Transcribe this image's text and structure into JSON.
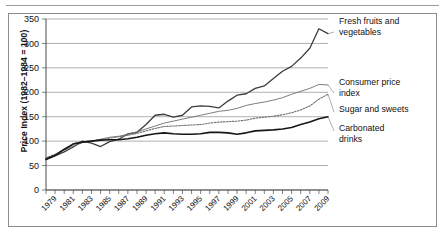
{
  "chart_data": {
    "type": "line",
    "title": "",
    "xlabel": "",
    "ylabel": "Price Index (1982–1984 = 100)",
    "ylim": [
      0,
      350
    ],
    "yticks": [
      0,
      50,
      100,
      150,
      200,
      250,
      300,
      350
    ],
    "grid": true,
    "legend_position": "right-inline-labels",
    "xlim": [
      1978,
      2009
    ],
    "x": [
      1978,
      1979,
      1980,
      1981,
      1982,
      1983,
      1984,
      1985,
      1986,
      1987,
      1988,
      1989,
      1990,
      1991,
      1992,
      1993,
      1994,
      1995,
      1996,
      1997,
      1998,
      1999,
      2000,
      2001,
      2002,
      2003,
      2004,
      2005,
      2006,
      2007,
      2008,
      2009
    ],
    "xticks": [
      1978,
      1979,
      1980,
      1981,
      1982,
      1983,
      1984,
      1985,
      1986,
      1987,
      1988,
      1989,
      1990,
      1991,
      1992,
      1993,
      1994,
      1995,
      1996,
      1997,
      1998,
      1999,
      2000,
      2001,
      2002,
      2003,
      2004,
      2005,
      2006,
      2007,
      2008,
      2009
    ],
    "xtick_labels_shown": [
      1979,
      1981,
      1983,
      1985,
      1987,
      1989,
      1991,
      1993,
      1995,
      1997,
      1999,
      2001,
      2003,
      2005,
      2007,
      2009
    ],
    "series": [
      {
        "name": "Fresh fruits and vegetables",
        "style": "solid",
        "color": "#3c3c3c",
        "width": 1.3,
        "values": [
          62,
          70,
          78,
          88,
          100,
          96,
          89,
          99,
          104,
          115,
          118,
          134,
          153,
          155,
          149,
          153,
          170,
          172,
          171,
          168,
          182,
          194,
          197,
          208,
          213,
          228,
          243,
          253,
          270,
          290,
          330,
          320
        ]
      },
      {
        "name": "Consumer price index",
        "style": "solid-thin",
        "color": "#6e6e6e",
        "width": 0.9,
        "values": [
          65,
          72,
          82,
          90,
          97,
          100,
          104,
          108,
          110,
          114,
          119,
          125,
          131,
          137,
          141,
          145,
          149,
          153,
          157,
          161,
          163,
          167,
          173,
          177,
          180,
          184,
          189,
          196,
          202,
          208,
          216,
          215
        ]
      },
      {
        "name": "Sugar and sweets",
        "style": "dotted",
        "color": "#6e6e6e",
        "width": 1.1,
        "values": [
          66,
          73,
          84,
          95,
          99,
          100,
          103,
          106,
          109,
          112,
          116,
          121,
          126,
          130,
          131,
          132,
          133,
          134,
          137,
          139,
          140,
          141,
          143,
          147,
          149,
          151,
          154,
          158,
          164,
          172,
          186,
          196
        ]
      },
      {
        "name": "Carbonated drinks",
        "style": "solid-bold",
        "color": "#161616",
        "width": 1.6,
        "values": [
          63,
          71,
          83,
          94,
          98,
          100,
          102,
          103,
          103,
          105,
          108,
          112,
          115,
          117,
          115,
          114,
          114,
          115,
          118,
          118,
          117,
          114,
          117,
          121,
          122,
          123,
          125,
          128,
          134,
          139,
          146,
          150
        ]
      }
    ],
    "annotations": [
      {
        "label": "Fresh fruits and vegetables",
        "series": "Fresh fruits and vegetables",
        "lines": [
          "Fresh fruits and",
          "vegetables"
        ]
      },
      {
        "label": "Consumer price index",
        "series": "Consumer price index",
        "lines": [
          "Consumer price",
          "index"
        ]
      },
      {
        "label": "Sugar and sweets",
        "series": "Sugar and sweets",
        "lines": [
          "Sugar and sweets"
        ]
      },
      {
        "label": "Carbonated drinks",
        "series": "Carbonated drinks",
        "lines": [
          "Carbonated",
          "drinks"
        ]
      }
    ]
  },
  "axis": {
    "y_title": "Price Index (1982–1984 = 100)",
    "y_tick_labels": [
      "350",
      "300",
      "250",
      "200",
      "150",
      "100",
      "50",
      "0"
    ],
    "x_tick_labels": [
      "1979",
      "1981",
      "1983",
      "1985",
      "1987",
      "1989",
      "1991",
      "1993",
      "1995",
      "1997",
      "1999",
      "2001",
      "2003",
      "2005",
      "2007",
      "2009"
    ]
  },
  "labels": {
    "fresh_line1": "Fresh fruits and",
    "fresh_line2": "vegetables",
    "cpi_line1": "Consumer price",
    "cpi_line2": "index",
    "sugar_line1": "Sugar and sweets",
    "carb_line1": "Carbonated",
    "carb_line2": "drinks"
  },
  "colors": {
    "fresh": "#3c3c3c",
    "cpi": "#6e6e6e",
    "sugar": "#6e6e6e",
    "carbonated": "#161616",
    "grid": "#8d8d8d",
    "frame": "#8d8d8d",
    "text": "#111111"
  }
}
